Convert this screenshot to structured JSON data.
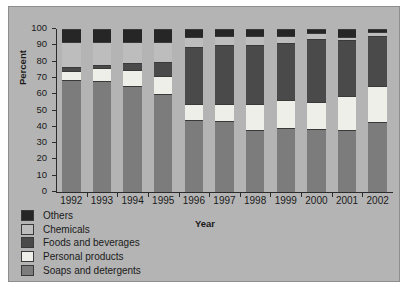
{
  "chart_data": {
    "type": "bar",
    "subtype": "stacked-100-percent",
    "title": "",
    "xlabel": "Year",
    "ylabel": "Percent",
    "ylim": [
      0,
      100
    ],
    "yticks": [
      0,
      10,
      20,
      30,
      40,
      50,
      60,
      70,
      80,
      90,
      100
    ],
    "grid": false,
    "legend_position": "bottom-left",
    "categories": [
      "1992",
      "1993",
      "1994",
      "1995",
      "1996",
      "1997",
      "1998",
      "1999",
      "2000",
      "2001",
      "2002"
    ],
    "series": [
      {
        "name": "Soaps and detergents",
        "color": "#7c7c7c",
        "values": [
          69,
          68,
          65,
          60,
          44,
          43.5,
          38,
          39.5,
          38.5,
          38,
          43
        ]
      },
      {
        "name": "Personal products",
        "color": "#efefe9",
        "values": [
          5,
          8,
          10,
          11,
          10,
          10.5,
          16,
          17,
          16.5,
          21,
          22
        ]
      },
      {
        "name": "Foods and beverages",
        "color": "#4a4a4a",
        "values": [
          3,
          2,
          4,
          9,
          35,
          36,
          36,
          35,
          39,
          34,
          31
        ]
      },
      {
        "name": "Chemicals",
        "color": "#bdbdbd",
        "values": [
          15,
          14,
          13,
          12,
          6,
          5.5,
          5.5,
          4.5,
          3.5,
          2,
          2
        ]
      },
      {
        "name": "Others",
        "color": "#262626",
        "values": [
          8,
          8,
          8,
          8,
          5,
          4.5,
          4.5,
          4,
          2.5,
          5,
          2
        ]
      }
    ]
  },
  "figure": {
    "background_color": "#b4b4b4",
    "border_color": "#8e8e8e",
    "page_background": "#ffffff"
  }
}
